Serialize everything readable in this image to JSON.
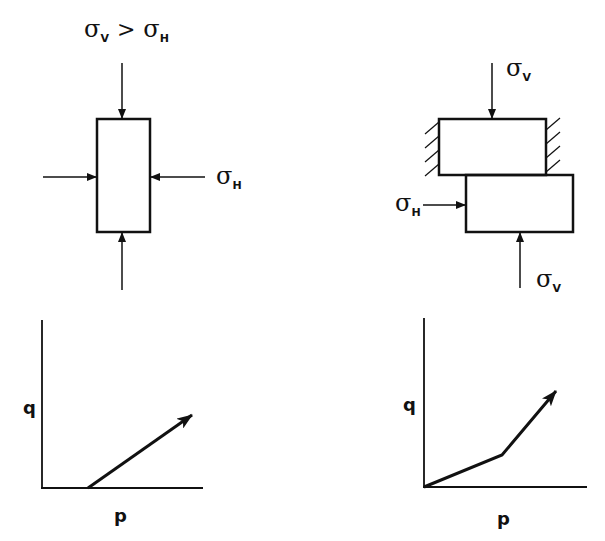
{
  "panels": {
    "triaxial": {
      "top_label": {
        "sym1": "σ",
        "sub1": "V",
        "op": ">",
        "sym2": "σ",
        "sub2": "H"
      },
      "side_label": {
        "sym": "σ",
        "sub": "H"
      }
    },
    "direct_shear": {
      "top_label": {
        "sym": "σ",
        "sub": "V"
      },
      "side_label": {
        "sym": "σ",
        "sub": "H"
      },
      "bottom_label": {
        "sym": "σ",
        "sub": "V"
      }
    },
    "stress_path_left": {
      "ylabel": "q",
      "xlabel": "p"
    },
    "stress_path_right": {
      "ylabel": "q",
      "xlabel": "p"
    }
  },
  "colors": {
    "ink": "#111111",
    "background": "#ffffff"
  }
}
